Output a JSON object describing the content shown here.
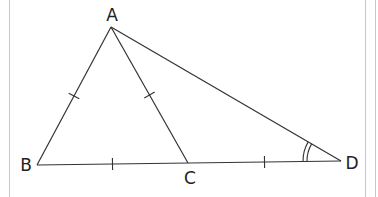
{
  "figure": {
    "type": "geometry-diagram",
    "colors": {
      "stroke": "#333333",
      "border": "#c8c8c8",
      "background": "#ffffff"
    },
    "points": {
      "A": {
        "label": "A",
        "x": 111,
        "y": 27,
        "label_x": 112,
        "label_y": 15
      },
      "B": {
        "label": "B",
        "x": 37,
        "y": 165,
        "label_x": 26,
        "label_y": 165
      },
      "C": {
        "label": "C",
        "x": 188,
        "y": 163,
        "label_x": 190,
        "label_y": 178
      },
      "D": {
        "label": "D",
        "x": 341,
        "y": 161,
        "label_x": 352,
        "label_y": 163
      }
    },
    "segments": [
      {
        "from": "A",
        "to": "B"
      },
      {
        "from": "A",
        "to": "C"
      },
      {
        "from": "A",
        "to": "D"
      },
      {
        "from": "B",
        "to": "D"
      }
    ],
    "tick_marks": [
      {
        "segment": "AB",
        "count": 1
      },
      {
        "segment": "AC",
        "count": 1
      },
      {
        "segment": "BC",
        "count": 1
      },
      {
        "segment": "CD",
        "count": 1
      }
    ],
    "angle_marks": [
      {
        "vertex": "D",
        "between": [
          "A",
          "B"
        ],
        "arcs": 2
      }
    ]
  }
}
